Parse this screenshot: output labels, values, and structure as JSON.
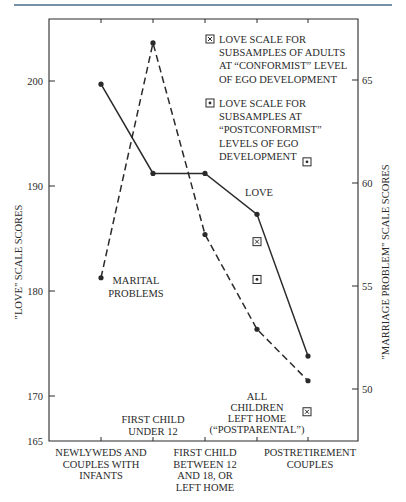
{
  "chart_data": {
    "type": "line",
    "title": "",
    "xlabel": "",
    "ylabel": "\"LOVE\" SCALE SCORES",
    "ylabel_right": "\"MARRIAGE PROBLEM\" SCALE SCORES",
    "ylim": [
      165,
      205
    ],
    "ylim_right": [
      47.5,
      67.5
    ],
    "grid": false,
    "categories": [
      "NEWLYWEDS AND COUPLES WITH INFANTS",
      "FIRST CHILD UNDER 12",
      "FIRST CHILD BETWEEN 12 AND 18, OR LEFT HOME",
      "ALL CHILDREN LEFT HOME (\"POSTPARENTAL\")",
      "POSTRETIREMENT COUPLES"
    ],
    "left_ticks": [
      165,
      170,
      180,
      190,
      200
    ],
    "right_ticks": [
      50,
      55,
      60,
      65
    ],
    "series": [
      {
        "name": "LOVE",
        "axis": "left",
        "style": "solid",
        "values": [
          199.7,
          191.2,
          191.2,
          187.3,
          173.8
        ]
      },
      {
        "name": "MARITAL PROBLEMS",
        "axis": "right",
        "style": "dashed",
        "values": [
          55.4,
          66.8,
          57.5,
          52.9,
          50.4
        ]
      }
    ],
    "markers": [
      {
        "name": "LOVE SCALE FOR SUBSAMPLES OF ADULTS AT \"CONFORMIST\" LEVEL OF EGO DEVELOPMENT",
        "symbol": "boxed-x",
        "points": [
          {
            "category_index": 3,
            "value": 184.7
          },
          {
            "category_index": 4,
            "value": 168.5
          }
        ]
      },
      {
        "name": "LOVE SCALE FOR SUBSAMPLES AT \"POSTCONFORMIST\" LEVELS OF EGO DEVELOPMENT",
        "symbol": "boxed-dot",
        "points": [
          {
            "category_index": 3,
            "value": 181.1
          },
          {
            "category_index": 4,
            "value": 192.3
          }
        ]
      }
    ],
    "legend": [
      {
        "symbol": "boxed-x",
        "lines": [
          "LOVE SCALE FOR",
          "SUBSAMPLES OF ADULTS",
          "AT “CONFORMIST” LEVEL",
          "OF EGO DEVELOPMENT"
        ]
      },
      {
        "symbol": "boxed-dot",
        "lines": [
          "LOVE SCALE FOR",
          "SUBSAMPLES AT",
          "“POSTCONFORMIST”",
          "LEVELS OF EGO",
          "DEVELOPMENT"
        ]
      }
    ],
    "legend_position": "upper right",
    "annotations": [
      {
        "text": [
          "MARITAL",
          "PROBLEMS"
        ]
      },
      {
        "text": [
          "LOVE"
        ]
      }
    ],
    "category_label_lines": [
      [
        "NEWLYWEDS AND",
        "COUPLES WITH",
        "INFANTS"
      ],
      [
        "FIRST CHILD",
        "UNDER 12"
      ],
      [
        "FIRST CHILD",
        "BETWEEN 12",
        "AND 18, OR",
        "LEFT HOME"
      ],
      [
        "ALL",
        "CHILDREN",
        "LEFT HOME",
        "(“POSTPARENTAL”)"
      ],
      [
        "POSTRETIREMENT",
        "COUPLES"
      ]
    ],
    "colors": {
      "ink": "#2a2a2a",
      "rule": "#4a6a8a"
    }
  }
}
